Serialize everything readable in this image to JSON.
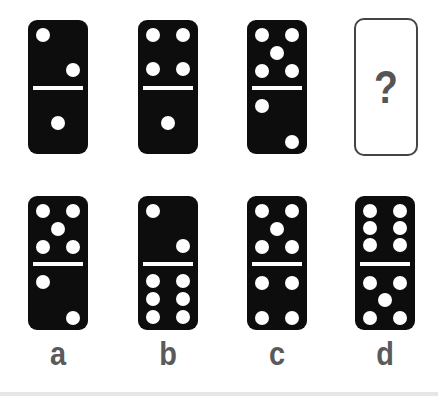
{
  "puzzle": {
    "sequence": [
      {
        "top": 2,
        "bottom": 1
      },
      {
        "top": 4,
        "bottom": 1
      },
      {
        "top": 5,
        "bottom": 2
      }
    ],
    "unknown_symbol": "?",
    "options": [
      {
        "label": "a",
        "top": 5,
        "bottom": 2
      },
      {
        "label": "b",
        "top": 2,
        "bottom": 6
      },
      {
        "label": "c",
        "top": 5,
        "bottom": 4
      },
      {
        "label": "d",
        "top": 6,
        "bottom": 5
      }
    ]
  },
  "colors": {
    "domino": "#0d0d0d",
    "pip": "#ffffff",
    "label": "#5a5a5a",
    "question_mark": "#555555",
    "card_border": "#444444"
  }
}
